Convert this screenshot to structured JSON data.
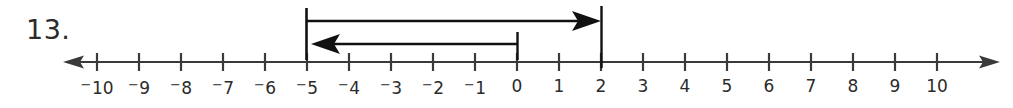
{
  "figure": {
    "problem_number": "13.",
    "type": "number-line-with-integer-arrows",
    "background_color": "#ffffff",
    "ink_color": "#2b2b2b"
  },
  "number_line": {
    "min": -10,
    "max": 10,
    "left_arrow": true,
    "right_arrow": true,
    "tick_labels": [
      {
        "value": -10,
        "negative": true,
        "digits": "10"
      },
      {
        "value": -9,
        "negative": true,
        "digits": "9"
      },
      {
        "value": -8,
        "negative": true,
        "digits": "8"
      },
      {
        "value": -7,
        "negative": true,
        "digits": "7"
      },
      {
        "value": -6,
        "negative": true,
        "digits": "6"
      },
      {
        "value": -5,
        "negative": true,
        "digits": "5"
      },
      {
        "value": -4,
        "negative": true,
        "digits": "4"
      },
      {
        "value": -3,
        "negative": true,
        "digits": "3"
      },
      {
        "value": -2,
        "negative": true,
        "digits": "2"
      },
      {
        "value": -1,
        "negative": true,
        "digits": "1"
      },
      {
        "value": 0,
        "negative": false,
        "digits": "0"
      },
      {
        "value": 1,
        "negative": false,
        "digits": "1"
      },
      {
        "value": 2,
        "negative": false,
        "digits": "2"
      },
      {
        "value": 3,
        "negative": false,
        "digits": "3"
      },
      {
        "value": 4,
        "negative": false,
        "digits": "4"
      },
      {
        "value": 5,
        "negative": false,
        "digits": "5"
      },
      {
        "value": 6,
        "negative": false,
        "digits": "6"
      },
      {
        "value": 7,
        "negative": false,
        "digits": "7"
      },
      {
        "value": 8,
        "negative": false,
        "digits": "8"
      },
      {
        "value": 9,
        "negative": false,
        "digits": "9"
      },
      {
        "value": 10,
        "negative": false,
        "digits": "10"
      }
    ]
  },
  "arrows": [
    {
      "name": "upper-arrow",
      "from": -5,
      "to": 2,
      "direction": "right",
      "length": 7,
      "row": "upper"
    },
    {
      "name": "lower-arrow",
      "from": 0,
      "to": -5,
      "direction": "left",
      "length": 5,
      "row": "lower"
    }
  ],
  "endpoint_bars": [
    {
      "name": "bar-at-neg5",
      "value": -5,
      "row": "upper"
    },
    {
      "name": "bar-at-zero",
      "value": 0,
      "row": "lower"
    },
    {
      "name": "bar-at-pos2",
      "value": 2,
      "row": "upper"
    }
  ],
  "chart_data": {
    "type": "line",
    "title": "",
    "xlabel": "",
    "ylabel": "",
    "xlim": [
      -10,
      10
    ],
    "grid": false,
    "x": [
      -10,
      -9,
      -8,
      -7,
      -6,
      -5,
      -4,
      -3,
      -2,
      -1,
      0,
      1,
      2,
      3,
      4,
      5,
      6,
      7,
      8,
      9,
      10
    ],
    "annotations": [
      {
        "label": "arrow from -5 to 2",
        "start": -5,
        "end": 2,
        "direction": "right"
      },
      {
        "label": "arrow from 0 to -5",
        "start": 0,
        "end": -5,
        "direction": "left"
      }
    ]
  }
}
